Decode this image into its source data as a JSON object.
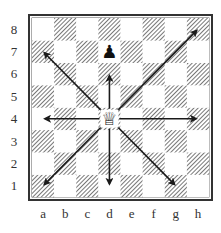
{
  "diagram": {
    "files": [
      "a",
      "b",
      "c",
      "d",
      "e",
      "f",
      "g",
      "h"
    ],
    "ranks": [
      "1",
      "2",
      "3",
      "4",
      "5",
      "6",
      "7",
      "8"
    ],
    "pieces": [
      {
        "name": "white-queen",
        "symbol": "♕",
        "square": "d4",
        "color": "white"
      },
      {
        "name": "black-pawn",
        "symbol": "♟",
        "square": "d7",
        "color": "black"
      }
    ],
    "arrows": [
      {
        "from": "d4",
        "to": "a7",
        "direction": "up-left"
      },
      {
        "from": "d4",
        "to": "d6",
        "direction": "up"
      },
      {
        "from": "d4",
        "to": "h8",
        "direction": "up-right"
      },
      {
        "from": "d4",
        "to": "a4",
        "direction": "left"
      },
      {
        "from": "d4",
        "to": "h4",
        "direction": "right"
      },
      {
        "from": "d4",
        "to": "a1",
        "direction": "down-left"
      },
      {
        "from": "d4",
        "to": "d1",
        "direction": "down"
      },
      {
        "from": "d4",
        "to": "g1",
        "direction": "down-right"
      }
    ],
    "colors": {
      "light_square": "#ffffff",
      "dark_hatch": "#555555",
      "border": "#333333",
      "arrow": "#1a1a1a"
    }
  }
}
